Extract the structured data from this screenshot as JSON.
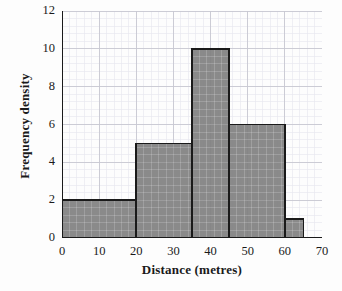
{
  "chart_data": {
    "type": "bar",
    "title": "",
    "subtitle": "",
    "xlabel": "Distance (metres)",
    "ylabel": "Frequency density",
    "xlim": [
      0,
      70
    ],
    "ylim": [
      0,
      12
    ],
    "x_ticks": [
      0,
      10,
      20,
      30,
      40,
      50,
      60,
      70
    ],
    "y_ticks": [
      0,
      2,
      4,
      6,
      8,
      10,
      12
    ],
    "x_tick_labels": [
      "0",
      "10",
      "20",
      "30",
      "40",
      "50",
      "60",
      "70"
    ],
    "y_tick_labels": [
      "0",
      "2",
      "4",
      "6",
      "8",
      "10",
      "12"
    ],
    "grid": true,
    "grid_minor": true,
    "legend": null,
    "bar_fill_color": "#808080",
    "bar_edge_color": "#1a1a1a",
    "grid_major_color": "#c8c8d2",
    "grid_minor_color": "#e6e6ee",
    "axis_color": "#1a1a1a",
    "bins": [
      {
        "label": "0-20",
        "x_start": 0,
        "x_end": 20,
        "value": 2
      },
      {
        "label": "20-35",
        "x_start": 20,
        "x_end": 35,
        "value": 5
      },
      {
        "label": "35-45",
        "x_start": 35,
        "x_end": 45,
        "value": 10
      },
      {
        "label": "45-60",
        "x_start": 45,
        "x_end": 60,
        "value": 6
      },
      {
        "label": "60-65",
        "x_start": 60,
        "x_end": 65,
        "value": 1
      }
    ],
    "categories": [
      "0-20",
      "20-35",
      "35-45",
      "45-60",
      "60-65"
    ],
    "values": [
      2,
      5,
      10,
      6,
      1
    ]
  }
}
